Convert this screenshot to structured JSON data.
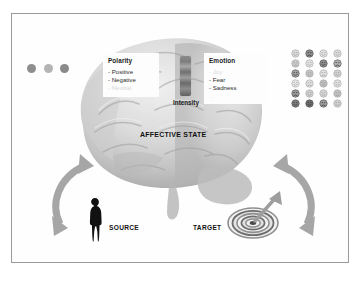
{
  "figure": {
    "title_visible": false,
    "background_color": "#ffffff",
    "border_color": "#9a9a9a"
  },
  "affective_state": {
    "label": "AFFECTIVE STATE"
  },
  "polarity": {
    "title": "Polarity",
    "items": [
      {
        "label": "- Positive",
        "state": "visible"
      },
      {
        "label": "- Negative",
        "state": "visible"
      },
      {
        "label": "- Neutral",
        "state": "faded"
      }
    ],
    "dots": [
      {
        "name": "polarity-dot-1",
        "color": "#8e8e8e"
      },
      {
        "name": "polarity-dot-2",
        "color": "#b4b4b4"
      },
      {
        "name": "polarity-dot-3",
        "color": "#8a8a8a"
      }
    ]
  },
  "emotion": {
    "title": "Emotion",
    "items": [
      {
        "label": "- Joy",
        "state": "faded"
      },
      {
        "label": "- Fear",
        "state": "visible"
      },
      {
        "label": "- Sadness",
        "state": "visible"
      },
      {
        "label": "...",
        "state": "visible"
      }
    ]
  },
  "intensity": {
    "label": "Intensity",
    "gradient_from": "#8a8a8a",
    "gradient_to": "#5f5f5f"
  },
  "source": {
    "label": "SOURCE",
    "icon": "person-silhouette-icon"
  },
  "target": {
    "label": "TARGET",
    "icon": "bullseye-target-icon"
  },
  "arrows": {
    "left": {
      "name": "curved-arrow-source-to-brain"
    },
    "right": {
      "name": "curved-arrow-brain-to-target"
    }
  },
  "emoticon_grid": {
    "columns": 4,
    "rows": 6,
    "faces": [
      {
        "shade": "#d9d9d9",
        "dark": false
      },
      {
        "shade": "#8c8c8c",
        "dark": true
      },
      {
        "shade": "#e2e2e2",
        "dark": false
      },
      {
        "shade": "#dcdcdc",
        "dark": false
      },
      {
        "shade": "#c9c9c9",
        "dark": false
      },
      {
        "shade": "#e4e4e4",
        "dark": false
      },
      {
        "shade": "#8f8f8f",
        "dark": true
      },
      {
        "shade": "#b0b0b0",
        "dark": true
      },
      {
        "shade": "#a3a3a3",
        "dark": true
      },
      {
        "shade": "#c4c4c4",
        "dark": false
      },
      {
        "shade": "#e0e0e0",
        "dark": false
      },
      {
        "shade": "#d2d2d2",
        "dark": false
      },
      {
        "shade": "#e6e6e6",
        "dark": false
      },
      {
        "shade": "#dedede",
        "dark": false
      },
      {
        "shade": "#bdbdbd",
        "dark": false
      },
      {
        "shade": "#e1e1e1",
        "dark": false
      },
      {
        "shade": "#9a9a9a",
        "dark": true
      },
      {
        "shade": "#cfcfcf",
        "dark": false
      },
      {
        "shade": "#d6d6d6",
        "dark": false
      },
      {
        "shade": "#c0c0c0",
        "dark": false
      },
      {
        "shade": "#7e7e7e",
        "dark": true
      },
      {
        "shade": "#6f6f6f",
        "dark": true
      },
      {
        "shade": "#9c9c9c",
        "dark": true
      },
      {
        "shade": "#d0d0d0",
        "dark": false
      }
    ]
  }
}
